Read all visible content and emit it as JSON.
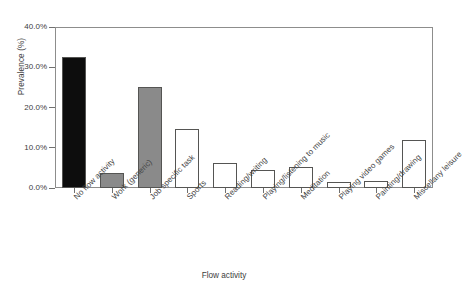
{
  "chart_data": {
    "type": "bar",
    "title": "",
    "subtitle": "",
    "xlabel": "Flow activity",
    "ylabel": "Prevalence (%)",
    "ylim": [
      0,
      40
    ],
    "ytick_values": [
      0,
      10,
      20,
      30,
      40
    ],
    "ytick_labels": [
      "0.0%",
      "10.0%",
      "20.0%",
      "30.0%",
      "40.0%"
    ],
    "grid": false,
    "legend": false,
    "legend_position": "none",
    "categories": [
      "No flow activity",
      "Work (generic)",
      "Job specific task",
      "Sports",
      "Reading/writing",
      "Playing/listening to music",
      "Meditation",
      "Playing video games",
      "Painting/drawing",
      "Miscellany leisure"
    ],
    "values": [
      32.5,
      3.7,
      25.1,
      14.7,
      6.3,
      4.4,
      5.1,
      1.6,
      1.8,
      12.0
    ],
    "value_labels": [
      "32.5%",
      "3.7%",
      "25.1%",
      "14.7%",
      "6.3%",
      "4.4%",
      "5.1%",
      "1.6%",
      "1.8%",
      "12.0%"
    ],
    "bar_colors": [
      "#0d0d0d",
      "#8a8a8a",
      "#8a8a8a",
      "#ffffff",
      "#ffffff",
      "#ffffff",
      "#ffffff",
      "#ffffff",
      "#ffffff",
      "#ffffff"
    ],
    "bar_edge_color": "#555553",
    "axis_color": "#8d8d8c",
    "text_color": "#3d3d3d"
  }
}
